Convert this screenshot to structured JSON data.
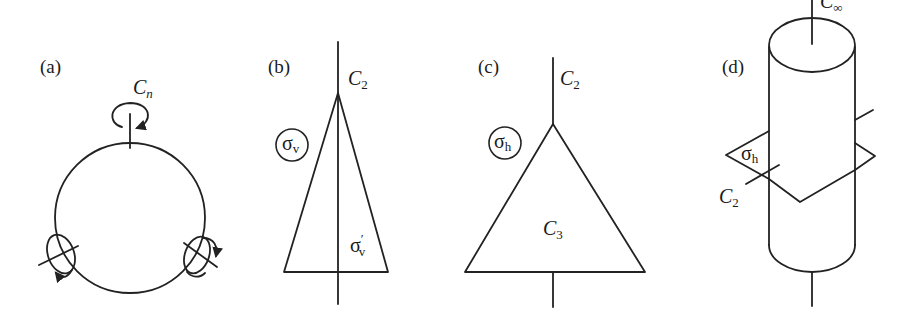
{
  "figure": {
    "stroke_color": "#222222",
    "background": "#ffffff"
  },
  "panels": [
    {
      "id": "a",
      "label": "(a)",
      "shape": "circle",
      "elements": [
        {
          "type": "rotation-axis",
          "symbol": "C",
          "subscript": "n",
          "position": "top"
        },
        {
          "type": "rotation-axis",
          "position": "lower-left",
          "label": ""
        },
        {
          "type": "rotation-axis",
          "position": "lower-right",
          "label": ""
        }
      ]
    },
    {
      "id": "b",
      "label": "(b)",
      "shape": "narrow-triangle",
      "elements": [
        {
          "type": "rotation-axis",
          "symbol": "C",
          "subscript": "2"
        },
        {
          "type": "mirror-plane",
          "symbol": "σ",
          "subscript": "v",
          "circled": true
        },
        {
          "type": "mirror-plane",
          "symbol": "σ",
          "subscript": "v",
          "prime": "′",
          "circled": false
        }
      ]
    },
    {
      "id": "c",
      "label": "(c)",
      "shape": "equilateral-triangle",
      "elements": [
        {
          "type": "rotation-axis",
          "symbol": "C",
          "subscript": "2"
        },
        {
          "type": "mirror-plane",
          "symbol": "σ",
          "subscript": "h",
          "circled": true
        },
        {
          "type": "rotation-axis",
          "symbol": "C",
          "subscript": "3"
        }
      ]
    },
    {
      "id": "d",
      "label": "(d)",
      "shape": "cylinder",
      "elements": [
        {
          "type": "rotation-axis",
          "symbol": "C",
          "subscript": "∞"
        },
        {
          "type": "mirror-plane",
          "symbol": "σ",
          "subscript": "h",
          "circled": false
        },
        {
          "type": "rotation-axis",
          "symbol": "C",
          "subscript": "2"
        }
      ]
    }
  ],
  "labels": {
    "a": {
      "panel": "(a)",
      "cn_main": "C",
      "cn_sub": "n"
    },
    "b": {
      "panel": "(b)",
      "c2_main": "C",
      "c2_sub": "2",
      "sv_main": "σ",
      "sv_sub": "v",
      "svp_main": "σ",
      "svp_prime": "′",
      "svp_sub": "v"
    },
    "c": {
      "panel": "(c)",
      "c2_main": "C",
      "c2_sub": "2",
      "sh_main": "σ",
      "sh_sub": "h",
      "c3_main": "C",
      "c3_sub": "3"
    },
    "d": {
      "panel": "(d)",
      "cinf_main": "C",
      "cinf_sub": "∞",
      "sh_main": "σ",
      "sh_sub": "h",
      "c2_main": "C",
      "c2_sub": "2"
    }
  }
}
